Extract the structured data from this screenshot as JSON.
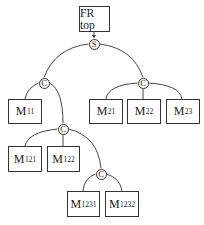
{
  "diagram": {
    "root": {
      "label": "FR top"
    },
    "operators": [
      {
        "id": "s",
        "label": "S"
      },
      {
        "id": "c1",
        "label": "C"
      },
      {
        "id": "c2",
        "label": "C"
      },
      {
        "id": "c12",
        "label": "C"
      },
      {
        "id": "c123",
        "label": "C"
      }
    ],
    "modules": [
      {
        "id": "m11",
        "base": "M",
        "sub": "11"
      },
      {
        "id": "m21",
        "base": "M",
        "sub": "21"
      },
      {
        "id": "m22",
        "base": "M",
        "sub": "22"
      },
      {
        "id": "m23",
        "base": "M",
        "sub": "23"
      },
      {
        "id": "m121",
        "base": "M",
        "sub": "121"
      },
      {
        "id": "m122",
        "base": "M",
        "sub": "122"
      },
      {
        "id": "m1231",
        "base": "M",
        "sub": "1231"
      },
      {
        "id": "m1232",
        "base": "M",
        "sub": "1232"
      }
    ]
  }
}
